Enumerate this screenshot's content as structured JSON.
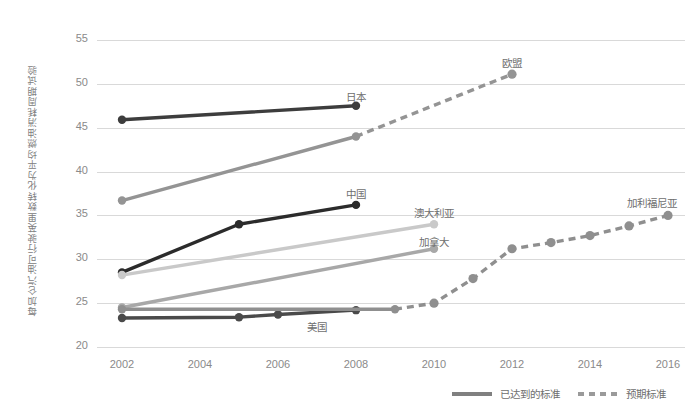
{
  "chart_data": {
    "type": "line",
    "title": "",
    "subtitle": "",
    "xlabel": "",
    "ylabel": "每加仑汽油可行驶英里数转化为平均燃油消耗周期试验",
    "xlim": [
      2001,
      2017
    ],
    "ylim": [
      20,
      55
    ],
    "grid": true,
    "x_ticks": [
      "2002",
      "2004",
      "2006",
      "2008",
      "2010",
      "2012",
      "2014",
      "2016"
    ],
    "y_ticks": [
      "20",
      "25",
      "30",
      "35",
      "40",
      "45",
      "50",
      "55"
    ],
    "legend_position": "bottom-right",
    "legend": [
      {
        "label": "已达到的标准",
        "style": "solid"
      },
      {
        "label": "预期标准",
        "style": "dashed"
      }
    ],
    "series": [
      {
        "name": "日本",
        "color": "#3d3d3d",
        "label_x": 2008,
        "label_y": 48.6,
        "achieved": {
          "x": [
            2002,
            2008
          ],
          "y": [
            45.9,
            47.5
          ]
        },
        "expected": {
          "x": [],
          "y": []
        }
      },
      {
        "name": "欧盟",
        "color": "#949494",
        "label_x": 2012,
        "label_y": 52.5,
        "achieved": {
          "x": [
            2002,
            2008
          ],
          "y": [
            36.7,
            44.0
          ]
        },
        "expected": {
          "x": [
            2008,
            2012
          ],
          "y": [
            44.0,
            51.1
          ]
        }
      },
      {
        "name": "中国",
        "color": "#2b2b2b",
        "label_x": 2008,
        "label_y": 37.6,
        "achieved": {
          "x": [
            2002,
            2005,
            2008
          ],
          "y": [
            28.5,
            34.0,
            36.2
          ]
        },
        "expected": {
          "x": [],
          "y": []
        }
      },
      {
        "name": "澳大利亚",
        "color": "#c9c9c9",
        "label_x": 2010,
        "label_y": 35.4,
        "achieved": {
          "x": [
            2002,
            2010
          ],
          "y": [
            28.2,
            34.0
          ]
        },
        "expected": {
          "x": [],
          "y": []
        }
      },
      {
        "name": "加拿大",
        "color": "#a8a8a8",
        "label_x": 2010,
        "label_y": 32.1,
        "achieved": {
          "x": [
            2002,
            2010
          ],
          "y": [
            24.5,
            31.2
          ]
        },
        "expected": {
          "x": [],
          "y": []
        }
      },
      {
        "name": "美国",
        "color": "#4a4a4a",
        "label_x": 2007,
        "label_y": 22.4,
        "achieved": {
          "x": [
            2002,
            2005,
            2006,
            2008
          ],
          "y": [
            23.3,
            23.4,
            23.7,
            24.2
          ]
        },
        "expected": {
          "x": [],
          "y": []
        }
      },
      {
        "name": "加利福尼亚",
        "color": "#8f8f8f",
        "label_x": 2015.6,
        "label_y": 36.5,
        "achieved": {
          "x": [
            2002,
            2009
          ],
          "y": [
            24.3,
            24.3
          ]
        },
        "expected": {
          "x": [
            2009,
            2010,
            2011,
            2012,
            2013,
            2014,
            2015,
            2016
          ],
          "y": [
            24.3,
            25.0,
            27.8,
            31.2,
            31.9,
            32.7,
            33.8,
            35.0
          ]
        }
      }
    ]
  }
}
